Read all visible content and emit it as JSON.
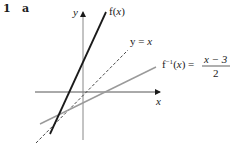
{
  "question": {
    "number": "1",
    "part": "a"
  },
  "axes": {
    "x_label": "x",
    "y_label": "y"
  },
  "curves": [
    {
      "name": "f",
      "label_func": "f(",
      "label_var": "x",
      "label_close": ")",
      "style": "solid",
      "color": "#1a1a1a"
    },
    {
      "name": "identity",
      "label_lhs": "y = ",
      "label_var": "x",
      "style": "dashed",
      "color": "#333333"
    },
    {
      "name": "f-inverse",
      "label_func": "f",
      "label_sup": "−1",
      "label_open": "(",
      "label_var": "x",
      "label_close": ") = ",
      "numerator": "x − 3",
      "denominator": "2",
      "style": "solid",
      "color": "#9a9a9a"
    }
  ]
}
